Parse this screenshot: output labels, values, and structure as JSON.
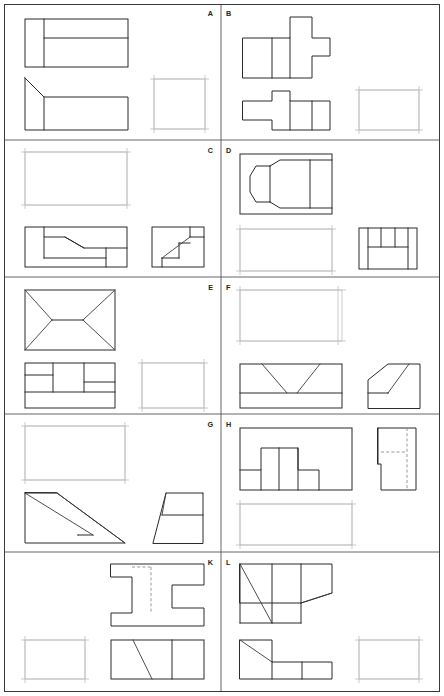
{
  "sheet": {
    "title": "Orthographic Projection Exercise Sheet",
    "width": 444,
    "height": 696,
    "background": "#ffffff",
    "line_color": "#2b2b2b",
    "construction_color": "#b9b9b9",
    "hidden_line_color": "#8d8d8d",
    "columns": 2,
    "rows": 5,
    "cell_count": 10,
    "description": "Technical drawing worksheet: each lettered cell shows two completed orthographic views of a solid plus one light construction rectangle where the missing third view is to be drawn."
  },
  "cells": [
    {
      "letter": "A",
      "row": 1,
      "column": 1,
      "given_views": [
        "top",
        "front"
      ],
      "missing_view": "side",
      "missing_view_position": "right",
      "notes": "Top view rectangle with vertical division near left and horizontal division; front view rectangle with chamfered upper-left corner."
    },
    {
      "letter": "B",
      "row": 1,
      "column": 2,
      "given_views": [
        "top",
        "front"
      ],
      "missing_view": "side",
      "missing_view_position": "right",
      "notes": "Top view cross/plus shaped block with two vertical divisions; front view stepped T shape with two vertical divisions."
    },
    {
      "letter": "C",
      "row": 2,
      "column": 1,
      "given_views": [
        "front",
        "side"
      ],
      "missing_view": "top",
      "missing_view_position": "top-left",
      "notes": "Front view stepped block with inclined surface; side view with diagonal stair line."
    },
    {
      "letter": "D",
      "row": 2,
      "column": 2,
      "given_views": [
        "top",
        "side"
      ],
      "missing_view": "front",
      "missing_view_position": "bottom-left",
      "notes": "Top view hexagonal chamfered boss inside rectangle; side view rectangle with three vertical divisions and a horizontal ledge."
    },
    {
      "letter": "E",
      "row": 3,
      "column": 1,
      "given_views": [
        "top",
        "front"
      ],
      "missing_view": "side",
      "missing_view_position": "right",
      "notes": "Top view hip-roof pattern with X diagonals and centre ridge; front view rectangle with ledge divisions."
    },
    {
      "letter": "F",
      "row": 3,
      "column": 2,
      "given_views": [
        "front",
        "side"
      ],
      "missing_view": "top",
      "missing_view_position": "top-left",
      "notes": "Front view rectangle with V-groove diagonals; side view trapezoid prism with inclined face line."
    },
    {
      "letter": "G",
      "row": 4,
      "column": 1,
      "given_views": [
        "front",
        "side"
      ],
      "missing_view": "top",
      "missing_view_position": "top-left",
      "notes": "Front view double wedge with parallel inclined lines; side view narrow inclined wedge."
    },
    {
      "letter": "H",
      "row": 4,
      "column": 2,
      "given_views": [
        "top",
        "side"
      ],
      "missing_view": "front",
      "missing_view_position": "bottom-left",
      "notes": "Top view rectangle with stepped slot profile; side view L-shaped bracket with hidden (dashed) lines."
    },
    {
      "letter": "K",
      "row": 5,
      "column": 1,
      "given_views": [
        "top",
        "front"
      ],
      "missing_view": "side",
      "missing_view_position": "bottom-left",
      "notes": "Top view H / I-beam profile with hidden dashed line; front view rectangle with inclined line and vertical division."
    },
    {
      "letter": "L",
      "row": 5,
      "column": 2,
      "given_views": [
        "top",
        "front"
      ],
      "missing_view": "side",
      "missing_view_position": "bottom-right",
      "notes": "Top view rectangle with diagonal and angled cutaway flap; front view stepped L-block with chamfer."
    }
  ],
  "legend": {
    "solid_line": "visible edge",
    "dashed_line": "hidden edge",
    "light_line": "construction rectangle for missing view"
  }
}
